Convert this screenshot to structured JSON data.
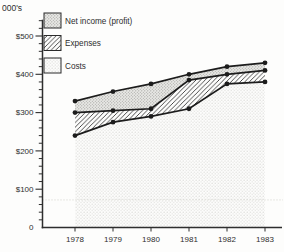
{
  "chart_data": {
    "type": "area",
    "stacked": true,
    "title": "",
    "unit": "thousands of dollars ($000's)",
    "categories": [
      "1978",
      "1979",
      "1980",
      "1981",
      "1982",
      "1983"
    ],
    "series": [
      {
        "name": "Costs",
        "pattern": "fine-dots",
        "values": [
          240,
          275,
          290,
          310,
          375,
          380
        ]
      },
      {
        "name": "Expenses",
        "pattern": "diagonal-hatch",
        "values": [
          60,
          30,
          20,
          75,
          25,
          30
        ]
      },
      {
        "name": "Net income (profit)",
        "pattern": "stipple",
        "values": [
          30,
          50,
          65,
          15,
          20,
          20
        ]
      }
    ],
    "boundary_lines": {
      "costs": [
        240,
        275,
        290,
        310,
        375,
        380
      ],
      "costs_plus_expenses": [
        300,
        305,
        310,
        385,
        400,
        410
      ],
      "total_revenue": [
        330,
        355,
        375,
        400,
        420,
        430
      ]
    },
    "legend": {
      "position": "top-left",
      "entries": [
        {
          "label": "Net income (profit)",
          "pattern": "stipple"
        },
        {
          "label": "Expenses",
          "pattern": "diagonal-hatch"
        },
        {
          "label": "Costs",
          "pattern": "fine-dots"
        }
      ]
    },
    "y_axis": {
      "unit_label": "000's",
      "tick_labels": [
        "$500",
        "$400",
        "$300",
        "$200",
        "$100",
        "0"
      ],
      "tick_values": [
        500,
        400,
        300,
        200,
        100,
        0
      ],
      "minor_tick_step": 20,
      "range": [
        0,
        540
      ],
      "grid": false
    },
    "x_axis": {
      "labels": [
        "1978",
        "1979",
        "1980",
        "1981",
        "1982",
        "1983"
      ]
    },
    "colors": {
      "line": "#1c1c1c",
      "marker": "#1c1c1c",
      "axis": "#2e2e2e",
      "text": "#2e2e2e",
      "stipple_bg": "#e8e8e5",
      "stipple_dot": "#9b9b97",
      "hatch_line": "#3a3a3a",
      "fine_dot": "#c7c7c3",
      "artifact_line": "#d2d2cc"
    },
    "artifact_dotted_line_value": 72
  }
}
